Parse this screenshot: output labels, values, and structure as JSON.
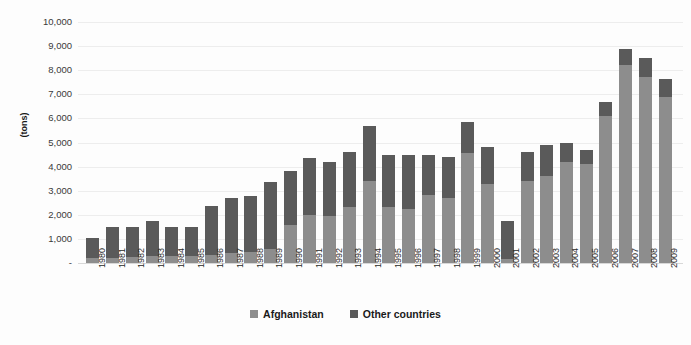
{
  "chart_data": {
    "type": "bar",
    "subtype": "stacked-bar",
    "title": "",
    "xlabel": "",
    "ylabel": "(tons)",
    "ylim": [
      0,
      10000
    ],
    "ytick_step": 1000,
    "grid": true,
    "legend_position": "bottom-center",
    "categories": [
      "1980",
      "1981",
      "1982",
      "1983",
      "1984",
      "1985",
      "1986",
      "1987",
      "1988",
      "1989",
      "1990",
      "1991",
      "1992",
      "1993",
      "1994",
      "1995",
      "1996",
      "1997",
      "1998",
      "1999",
      "2000",
      "2001",
      "2002",
      "2003",
      "2004",
      "2005",
      "2006",
      "2007",
      "2008",
      "2009"
    ],
    "y_tick_labels": [
      "-",
      "1,000",
      "2,000",
      "3,000",
      "4,000",
      "5,000",
      "6,000",
      "7,000",
      "8,000",
      "9,000",
      "10,000"
    ],
    "y_tick_values": [
      0,
      1000,
      2000,
      3000,
      4000,
      5000,
      6000,
      7000,
      8000,
      9000,
      10000
    ],
    "series": [
      {
        "name": "Afghanistan",
        "color": "#8d8d8d",
        "values": [
          200,
          225,
          250,
          300,
          300,
          300,
          350,
          400,
          450,
          600,
          1570,
          1980,
          1970,
          2330,
          3416,
          2335,
          2248,
          2804,
          2693,
          4565,
          3276,
          185,
          3400,
          3600,
          4200,
          4100,
          6100,
          8200,
          7700,
          6900
        ]
      },
      {
        "name": "Other countries",
        "color": "#5a5a5a",
        "values": [
          830,
          1275,
          1250,
          1450,
          1200,
          1200,
          2000,
          2300,
          2350,
          2750,
          2230,
          2370,
          2230,
          2270,
          2284,
          2165,
          2252,
          1696,
          1707,
          1285,
          1524,
          1545,
          1200,
          1300,
          800,
          600,
          600,
          700,
          800,
          750
        ]
      }
    ],
    "totals": [
      1030,
      1500,
      1500,
      1750,
      1500,
      1500,
      2350,
      2700,
      2800,
      3350,
      3800,
      4350,
      4200,
      4600,
      5700,
      4500,
      4500,
      4500,
      4400,
      5850,
      4800,
      1730,
      4600,
      4900,
      5000,
      4700,
      6700,
      8900,
      8500,
      7650
    ]
  },
  "legend": {
    "items": [
      {
        "label": "Afghanistan",
        "color": "#8d8d8d",
        "swatch_name": "legend-swatch-afghanistan"
      },
      {
        "label": "Other countries",
        "color": "#5a5a5a",
        "swatch_name": "legend-swatch-other-countries"
      }
    ]
  }
}
